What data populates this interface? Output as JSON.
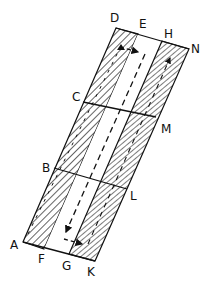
{
  "diagram": {
    "points": {
      "D": [
        116,
        28
      ],
      "E": [
        138,
        34
      ],
      "H": [
        162,
        41
      ],
      "N": [
        189,
        49
      ],
      "A": [
        23,
        242
      ],
      "F": [
        44,
        249
      ],
      "G": [
        69,
        254
      ],
      "K": [
        95,
        261
      ],
      "C": [
        83,
        102
      ],
      "M": [
        156,
        117
      ],
      "B": [
        54,
        168
      ],
      "L": [
        127,
        189
      ]
    },
    "labels": {
      "D": "D",
      "E": "E",
      "H": "H",
      "N": "N",
      "A": "A",
      "F": "F",
      "G": "G",
      "K": "K",
      "C": "C",
      "M": "M",
      "B": "B",
      "L": "L"
    },
    "regions": [
      {
        "name": "left-hatched-strip",
        "corners": [
          "D",
          "E",
          "F",
          "A"
        ],
        "fill": "hatch"
      },
      {
        "name": "center-clear-strip",
        "corners": [
          "E",
          "H",
          "G",
          "F"
        ],
        "fill": "none"
      },
      {
        "name": "right-hatched-strip",
        "corners": [
          "H",
          "N",
          "K",
          "G"
        ],
        "fill": "hatch"
      }
    ],
    "cross_lines": [
      [
        "C",
        "M"
      ],
      [
        "B",
        "L"
      ]
    ],
    "flow": "dashed arrow path running down the center strip, turning right at the bottom into the right strip, up the right strip; arrows at top from left strip into center strip"
  }
}
